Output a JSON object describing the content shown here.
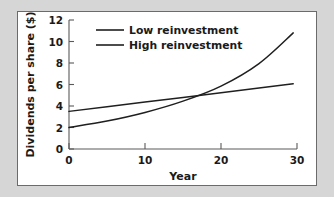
{
  "figure": {
    "background_color": "#d6d6d6",
    "panel_color": "#ffffff",
    "panel_border_color": "#6b6b6b",
    "line_color": "#1f1f1f"
  },
  "chart_data": {
    "type": "line",
    "title": "",
    "xlabel": "Year",
    "ylabel": "Dividends per share ($)",
    "xlim": [
      0,
      30
    ],
    "ylim": [
      0,
      12
    ],
    "xticks": [
      0,
      10,
      20,
      30
    ],
    "yticks": [
      0,
      2,
      4,
      6,
      8,
      10,
      12
    ],
    "xtick_labels": [
      "0",
      "10",
      "20",
      "30"
    ],
    "ytick_labels": [
      "0",
      "2",
      "4",
      "6",
      "8",
      "10",
      "12"
    ],
    "grid": false,
    "legend_position": "upper center inside",
    "series": [
      {
        "name": "Low reinvestment",
        "shape": "linear",
        "color": "#1f1f1f",
        "x": [
          0,
          5,
          10,
          15,
          20,
          25,
          29.5
        ],
        "values": [
          3.5,
          3.93,
          4.37,
          4.8,
          5.23,
          5.67,
          6.06
        ]
      },
      {
        "name": "High reinvestment",
        "shape": "exponential",
        "color": "#1f1f1f",
        "x": [
          0,
          5,
          10,
          15,
          20,
          25,
          29.5
        ],
        "values": [
          2.0,
          2.6,
          3.4,
          4.45,
          5.85,
          7.95,
          10.8
        ]
      }
    ],
    "annotations": {
      "crossover_year": 13.5,
      "crossover_value": 4.6
    }
  },
  "legend": {
    "entries": [
      {
        "label": "Low reinvestment"
      },
      {
        "label": "High reinvestment"
      }
    ]
  }
}
